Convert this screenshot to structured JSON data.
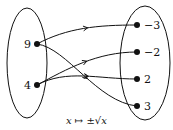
{
  "diagram": {
    "type": "function-mapping",
    "caption": "x ↦ ±√x",
    "domain_set": {
      "elements": [
        {
          "id": "d9",
          "label": "9"
        },
        {
          "id": "d4",
          "label": "4"
        }
      ]
    },
    "codomain_set": {
      "elements": [
        {
          "id": "cm3",
          "label": "−3"
        },
        {
          "id": "cm2",
          "label": "−2"
        },
        {
          "id": "c2",
          "label": "2"
        },
        {
          "id": "c3",
          "label": "3"
        }
      ]
    },
    "mappings": [
      {
        "from": "d9",
        "to": "cm3"
      },
      {
        "from": "d9",
        "to": "c3"
      },
      {
        "from": "d4",
        "to": "cm2"
      },
      {
        "from": "d4",
        "to": "c2"
      }
    ],
    "colors": {
      "stroke": "#111111",
      "background": "#ffffff"
    }
  }
}
